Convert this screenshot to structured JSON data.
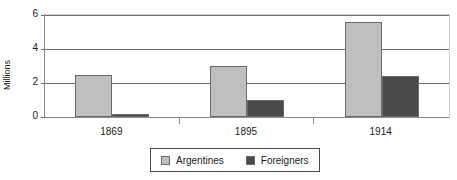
{
  "chart_data": {
    "type": "bar",
    "title": "",
    "subtitle": "",
    "xlabel": "",
    "ylabel": "Millions",
    "categories": [
      "1869",
      "1895",
      "1914"
    ],
    "series": [
      {
        "name": "Argentines",
        "values": [
          2.5,
          3.0,
          5.6
        ],
        "color": "#bfbfbf"
      },
      {
        "name": "Foreigners",
        "values": [
          0.2,
          1.0,
          2.4
        ],
        "color": "#4a4a4a"
      }
    ],
    "ylim": [
      0,
      6
    ],
    "yticks": [
      0,
      2,
      4,
      6
    ],
    "ytick_labels": [
      "0",
      "2",
      "4",
      "6"
    ],
    "grid": true,
    "grid_axis": "y",
    "legend_position": "bottom",
    "bar_border_color": "#6b6b6b",
    "gridline_color": "#6e6e6e",
    "axis_color": "#8a8a8a",
    "plot_background": "#ffffff"
  }
}
